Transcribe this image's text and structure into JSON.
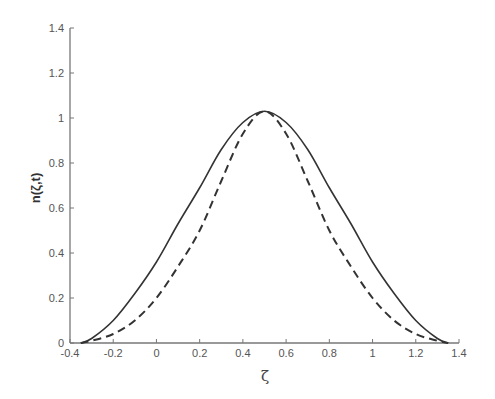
{
  "chart_data": {
    "type": "line",
    "title": "",
    "xlabel": "ζ",
    "ylabel": "n(ζ,t)",
    "xlim": [
      -0.4,
      1.4
    ],
    "ylim": [
      0,
      1.4
    ],
    "grid": false,
    "legend": null,
    "x_ticks": [
      "-0.4",
      "-0.2",
      "0",
      "0.2",
      "0.4",
      "0.6",
      "0.8",
      "1",
      "1.2",
      "1.4"
    ],
    "y_ticks": [
      "0",
      "0.2",
      "0.4",
      "0.6",
      "0.8",
      "1",
      "1.2",
      "1.4"
    ],
    "x": [
      -0.35,
      -0.3,
      -0.2,
      -0.1,
      0.0,
      0.1,
      0.2,
      0.3,
      0.4,
      0.5,
      0.6,
      0.7,
      0.8,
      0.9,
      1.0,
      1.1,
      1.2,
      1.3,
      1.35
    ],
    "series": [
      {
        "name": "solid",
        "style": "solid",
        "color": "#333333",
        "values": [
          0.0,
          0.02,
          0.1,
          0.22,
          0.36,
          0.53,
          0.69,
          0.86,
          0.98,
          1.03,
          0.98,
          0.86,
          0.69,
          0.53,
          0.36,
          0.22,
          0.1,
          0.02,
          0.0
        ]
      },
      {
        "name": "dashed",
        "style": "dashed",
        "color": "#333333",
        "values": [
          0.0,
          0.01,
          0.04,
          0.1,
          0.2,
          0.34,
          0.5,
          0.72,
          0.93,
          1.03,
          0.93,
          0.72,
          0.5,
          0.34,
          0.2,
          0.1,
          0.04,
          0.01,
          0.0
        ]
      }
    ]
  }
}
